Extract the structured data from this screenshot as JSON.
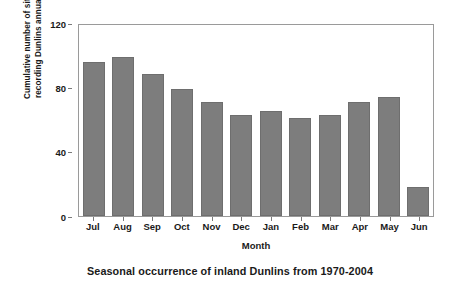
{
  "chart_data": {
    "type": "bar",
    "title": "Seasonal occurrence of inland Dunlins from 1970-2004",
    "xlabel": "Month",
    "ylabel": "Cumulative number of sites\nrecording Dunlins annually",
    "categories": [
      "Jul",
      "Aug",
      "Sep",
      "Oct",
      "Nov",
      "Dec",
      "Jan",
      "Feb",
      "Mar",
      "Apr",
      "May",
      "Jun"
    ],
    "values": [
      96,
      99,
      88,
      79,
      71,
      63,
      65,
      61,
      63,
      71,
      74,
      18
    ],
    "ylim": [
      0,
      120
    ],
    "yticks": [
      0,
      40,
      80,
      120
    ],
    "ytick_labels": [
      "0",
      "40",
      "80",
      "120"
    ],
    "grid": false,
    "legend": null,
    "bar_color": "#7d7d7d",
    "frame_color": "#9a9a9a",
    "background": "#ffffff"
  }
}
